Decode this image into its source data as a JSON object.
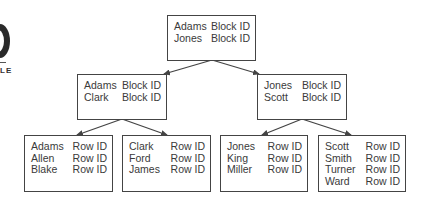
{
  "logo": {
    "text": "LE"
  },
  "tree": {
    "root": {
      "rows": [
        {
          "key": "Adams",
          "ptr": "Block ID"
        },
        {
          "key": "Jones",
          "ptr": "Block ID"
        }
      ]
    },
    "branches": [
      {
        "rows": [
          {
            "key": "Adams",
            "ptr": "Block ID"
          },
          {
            "key": "Clark",
            "ptr": "Block ID"
          }
        ]
      },
      {
        "rows": [
          {
            "key": "Jones",
            "ptr": "Block ID"
          },
          {
            "key": "Scott",
            "ptr": "Block ID"
          }
        ]
      }
    ],
    "leaves": [
      {
        "rows": [
          {
            "key": "Adams",
            "ptr": "Row ID"
          },
          {
            "key": "Allen",
            "ptr": "Row ID"
          },
          {
            "key": "Blake",
            "ptr": "Row ID"
          }
        ]
      },
      {
        "rows": [
          {
            "key": "Clark",
            "ptr": "Row ID"
          },
          {
            "key": "Ford",
            "ptr": "Row ID"
          },
          {
            "key": "James",
            "ptr": "Row ID"
          }
        ]
      },
      {
        "rows": [
          {
            "key": "Jones",
            "ptr": "Row ID"
          },
          {
            "key": "King",
            "ptr": "Row ID"
          },
          {
            "key": "Miller",
            "ptr": "Row ID"
          }
        ]
      },
      {
        "rows": [
          {
            "key": "Scott",
            "ptr": "Row ID"
          },
          {
            "key": "Smith",
            "ptr": "Row ID"
          },
          {
            "key": "Turner",
            "ptr": "Row ID"
          },
          {
            "key": "Ward",
            "ptr": "Row ID"
          }
        ]
      }
    ]
  },
  "colors": {
    "line": "#444444",
    "text": "#3a3a3a"
  }
}
